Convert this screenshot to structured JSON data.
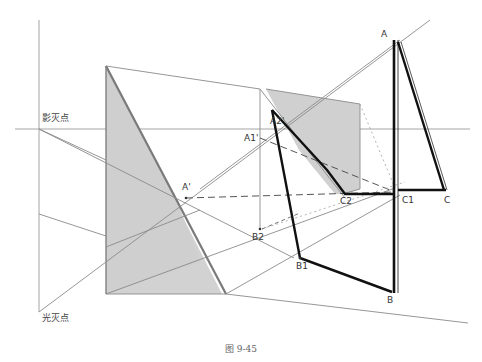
{
  "figure": {
    "caption": "图 9-45",
    "labels": {
      "shadow_vanishing_point": "影灭点",
      "light_vanishing_point": "光灭点",
      "A": "A",
      "A_prime": "A'",
      "A1": "A1'",
      "A2": "A2'",
      "B": "B",
      "B1": "B1",
      "B2": "B2",
      "C": "C",
      "C1": "C1",
      "C2": "C2"
    },
    "colors": {
      "background": "#ffffff",
      "thin_line": "#8a8a8a",
      "thick_line": "#111111",
      "shadow_fill": "#d0d0d0",
      "dashed_line": "#555555",
      "dotted_line": "#aaaaaa"
    }
  }
}
